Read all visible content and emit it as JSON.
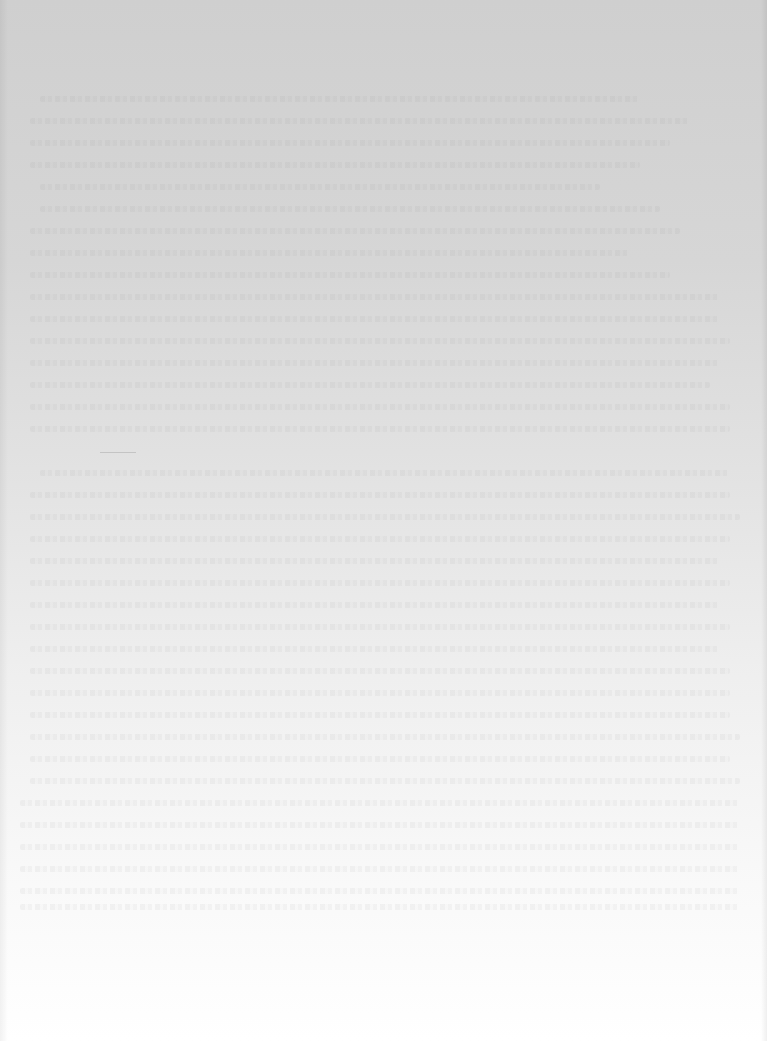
{
  "document": {
    "type": "scanned-page",
    "content_state": "blank-with-bleed-through",
    "legible_text": "",
    "colors": {
      "top": "#cfcfcf",
      "bottom": "#ffffff"
    },
    "bleed_lines": [
      {
        "top": 96,
        "left": 40,
        "width": 600
      },
      {
        "top": 118,
        "left": 30,
        "width": 660
      },
      {
        "top": 140,
        "left": 30,
        "width": 640
      },
      {
        "top": 162,
        "left": 30,
        "width": 610
      },
      {
        "top": 184,
        "left": 40,
        "width": 560
      },
      {
        "top": 206,
        "left": 40,
        "width": 620
      },
      {
        "top": 228,
        "left": 30,
        "width": 650
      },
      {
        "top": 250,
        "left": 30,
        "width": 600
      },
      {
        "top": 272,
        "left": 30,
        "width": 640
      },
      {
        "top": 294,
        "left": 30,
        "width": 690
      },
      {
        "top": 316,
        "left": 30,
        "width": 690
      },
      {
        "top": 338,
        "left": 30,
        "width": 700
      },
      {
        "top": 360,
        "left": 30,
        "width": 690
      },
      {
        "top": 382,
        "left": 30,
        "width": 680
      },
      {
        "top": 404,
        "left": 30,
        "width": 700
      },
      {
        "top": 426,
        "left": 30,
        "width": 700
      },
      {
        "top": 470,
        "left": 40,
        "width": 690
      },
      {
        "top": 492,
        "left": 30,
        "width": 700
      },
      {
        "top": 514,
        "left": 30,
        "width": 710
      },
      {
        "top": 536,
        "left": 30,
        "width": 700
      },
      {
        "top": 558,
        "left": 30,
        "width": 690
      },
      {
        "top": 580,
        "left": 30,
        "width": 700
      },
      {
        "top": 602,
        "left": 30,
        "width": 690
      },
      {
        "top": 624,
        "left": 30,
        "width": 700
      },
      {
        "top": 646,
        "left": 30,
        "width": 690
      },
      {
        "top": 668,
        "left": 30,
        "width": 700
      },
      {
        "top": 690,
        "left": 30,
        "width": 700
      },
      {
        "top": 712,
        "left": 30,
        "width": 700
      },
      {
        "top": 734,
        "left": 30,
        "width": 710
      },
      {
        "top": 756,
        "left": 30,
        "width": 700
      },
      {
        "top": 778,
        "left": 30,
        "width": 710
      },
      {
        "top": 800,
        "left": 20,
        "width": 720
      },
      {
        "top": 822,
        "left": 20,
        "width": 720
      },
      {
        "top": 844,
        "left": 20,
        "width": 720
      },
      {
        "top": 866,
        "left": 20,
        "width": 720
      },
      {
        "top": 888,
        "left": 20,
        "width": 720
      },
      {
        "top": 904,
        "left": 20,
        "width": 720
      }
    ]
  }
}
